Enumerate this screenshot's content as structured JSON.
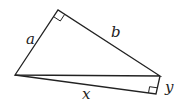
{
  "diagram": {
    "labels": {
      "a": "a",
      "b": "b",
      "x": "x",
      "y": "y"
    },
    "stroke_color": "#222222",
    "background": "#ffffff"
  }
}
